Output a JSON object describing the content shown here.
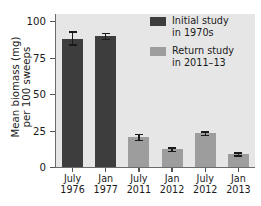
{
  "chart_data": {
    "type": "bar",
    "title": "",
    "xlabel": "",
    "ylabel_line1": "Mean biomass (mg)",
    "ylabel_line2": "per 100 sweeps",
    "ylim": [
      0,
      100
    ],
    "yticks": [
      0,
      25,
      50,
      75,
      100
    ],
    "ytick_labels": [
      "0",
      "25",
      "50",
      "75",
      "100"
    ],
    "grid": false,
    "legend_position": "top-right",
    "categories": [
      {
        "line1": "July",
        "line2": "1976"
      },
      {
        "line1": "Jan",
        "line2": "1977"
      },
      {
        "line1": "July",
        "line2": "2011"
      },
      {
        "line1": "Jan",
        "line2": "2012"
      },
      {
        "line1": "July",
        "line2": "2012"
      },
      {
        "line1": "Jan",
        "line2": "2013"
      }
    ],
    "values": [
      88,
      90,
      20.5,
      12.3,
      23,
      9
    ],
    "errors_low": [
      84,
      88,
      18.5,
      11.0,
      22.0,
      8.0
    ],
    "errors_high": [
      93,
      92,
      22.5,
      13.5,
      24.5,
      10.0
    ],
    "group_of_bar": [
      "initial",
      "initial",
      "return",
      "return",
      "return",
      "return"
    ],
    "series": [
      {
        "name": "initial",
        "legend_line1": "Initial study",
        "legend_line2": "in 1970s",
        "color": "#3d3d3d"
      },
      {
        "name": "return",
        "legend_line1": "Return study",
        "legend_line2": "in 2011–13",
        "color": "#9d9d9d"
      }
    ],
    "plot_background": "#e6e6e6",
    "axis_color": "#6b6b6b"
  }
}
